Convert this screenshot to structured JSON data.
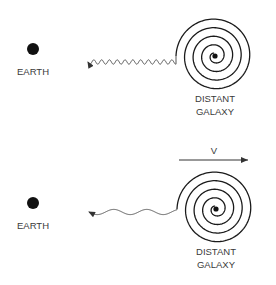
{
  "panels": [
    {
      "id": "stationary",
      "earth_label": "EARTH",
      "galaxy_label_line1": "DISTANT",
      "galaxy_label_line2": "GALAXY",
      "wave": "short-wavelength",
      "velocity_label": null
    },
    {
      "id": "receding",
      "earth_label": "EARTH",
      "galaxy_label_line1": "DISTANT",
      "galaxy_label_line2": "GALAXY",
      "wave": "long-wavelength (redshifted)",
      "velocity_label": "V"
    }
  ],
  "colors": {
    "ink": "#1a1a1a",
    "wave": "#555555",
    "label": "#3a3a3a"
  }
}
